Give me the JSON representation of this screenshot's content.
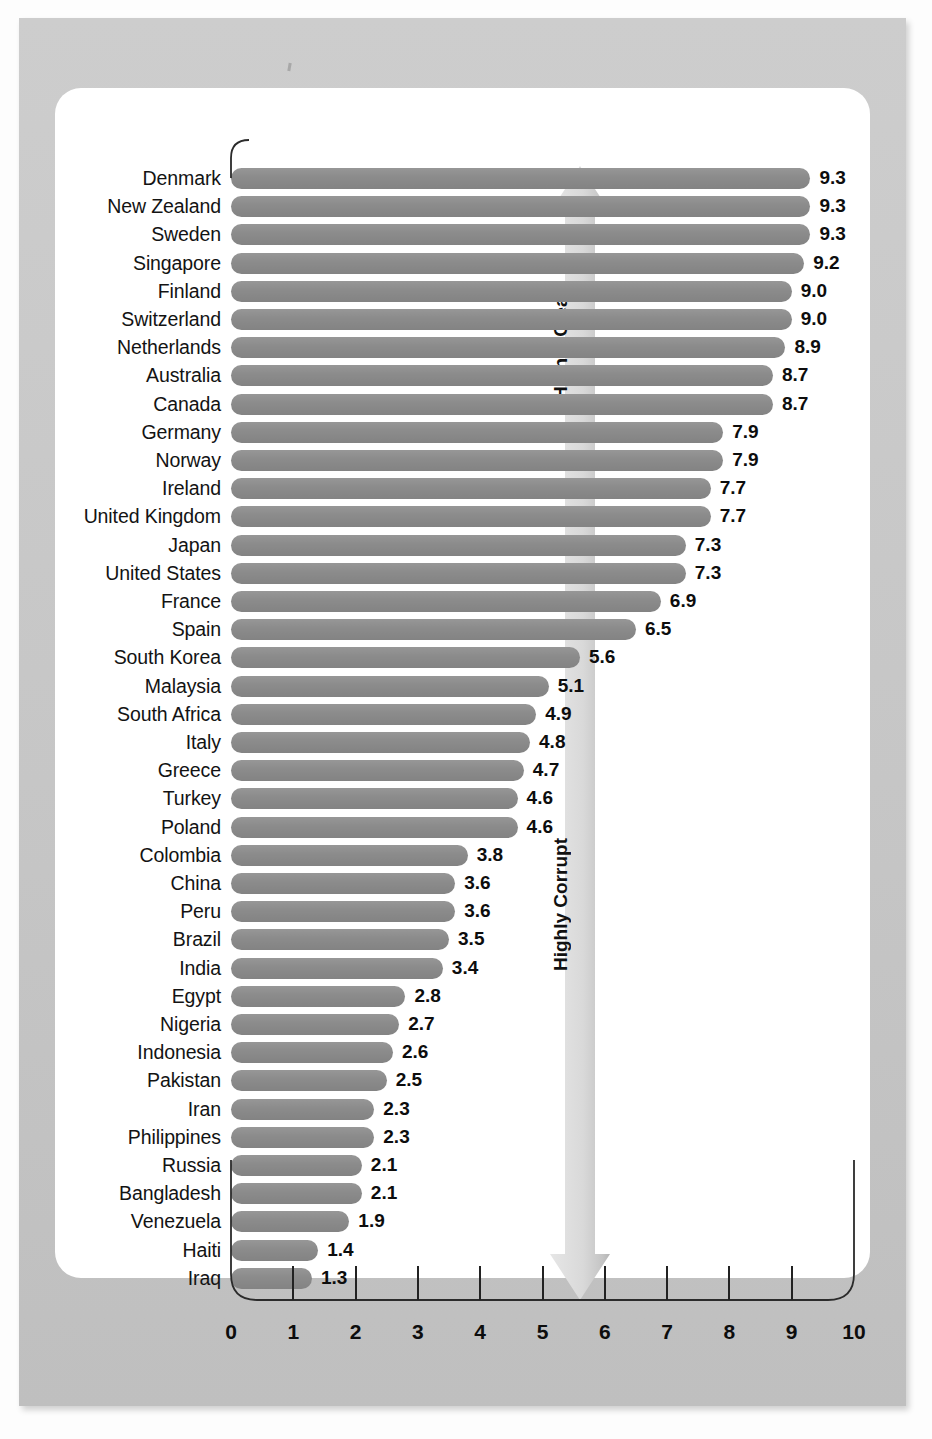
{
  "chart_data": {
    "type": "bar",
    "orientation": "horizontal",
    "title": "",
    "xlabel": "",
    "ylabel": "",
    "xlim": [
      0,
      10
    ],
    "grid": false,
    "tick_labels": [
      "0",
      "1",
      "2",
      "3",
      "4",
      "5",
      "6",
      "7",
      "8",
      "9",
      "10"
    ],
    "categories": [
      "Denmark",
      "New Zealand",
      "Sweden",
      "Singapore",
      "Finland",
      "Switzerland",
      "Netherlands",
      "Australia",
      "Canada",
      "Germany",
      "Norway",
      "Ireland",
      "United Kingdom",
      "Japan",
      "United States",
      "France",
      "Spain",
      "South Korea",
      "Malaysia",
      "South Africa",
      "Italy",
      "Greece",
      "Turkey",
      "Poland",
      "Colombia",
      "China",
      "Peru",
      "Brazil",
      "India",
      "Egypt",
      "Nigeria",
      "Indonesia",
      "Pakistan",
      "Iran",
      "Philippines",
      "Russia",
      "Bangladesh",
      "Venezuela",
      "Haiti",
      "Iraq"
    ],
    "values": [
      9.3,
      9.3,
      9.3,
      9.2,
      9.0,
      9.0,
      8.9,
      8.7,
      8.7,
      7.9,
      7.9,
      7.7,
      7.7,
      7.3,
      7.3,
      6.9,
      6.5,
      5.6,
      5.1,
      4.9,
      4.8,
      4.7,
      4.6,
      4.6,
      3.8,
      3.6,
      3.6,
      3.5,
      3.4,
      2.8,
      2.7,
      2.6,
      2.5,
      2.3,
      2.3,
      2.1,
      2.1,
      1.9,
      1.4,
      1.3
    ],
    "value_labels": [
      "9.3",
      "9.3",
      "9.3",
      "9.2",
      "9.0",
      "9.0",
      "8.9",
      "8.7",
      "8.7",
      "7.9",
      "7.9",
      "7.7",
      "7.7",
      "7.3",
      "7.3",
      "6.9",
      "6.5",
      "5.6",
      "5.1",
      "4.9",
      "4.8",
      "4.7",
      "4.6",
      "4.6",
      "3.8",
      "3.6",
      "3.6",
      "3.5",
      "3.4",
      "2.8",
      "2.7",
      "2.6",
      "2.5",
      "2.3",
      "2.3",
      "2.1",
      "2.1",
      "1.9",
      "1.4",
      "1.3"
    ],
    "annotations": [
      {
        "name": "up-arrow",
        "text": "Highly Clean",
        "direction": "up"
      },
      {
        "name": "down-arrow",
        "text": "Highly Corrupt",
        "direction": "down"
      }
    ],
    "colors": {
      "bar": "#8b8b8b",
      "frame": "#c9c9c9",
      "panel": "#ffffff",
      "arrow": "#d7d7d7",
      "text": "#111111"
    }
  }
}
